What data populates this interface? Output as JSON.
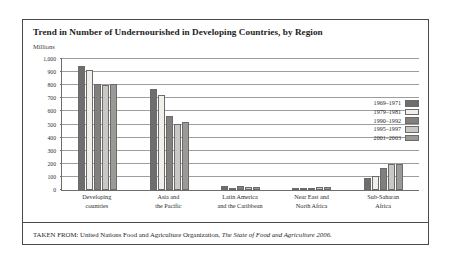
{
  "figure": {
    "title": "Trend in Number of Undernourished in Developing Countries, by Region",
    "unit_label": "Millions",
    "source_prefix": "TAKEN FROM: United Nations Food and Agriculture Organization,",
    "source_title": "The State of Food and Agriculture 2006."
  },
  "chart_data": {
    "type": "bar",
    "title": "Trend in Number of Undernourished in Developing Countries, by Region",
    "xlabel": "",
    "ylabel": "Millions",
    "ylim": [
      0,
      1000
    ],
    "yticks": [
      0,
      100,
      200,
      300,
      400,
      500,
      600,
      700,
      800,
      900,
      1000
    ],
    "ytick_labels": [
      "0",
      "100",
      "200",
      "300",
      "400",
      "500",
      "600",
      "700",
      "800",
      "900",
      "1,000"
    ],
    "grid": true,
    "legend_position": "right",
    "categories": [
      "Developing countries",
      "Asia and the Pacific",
      "Latin America and the Caribbean",
      "Near East and North Africa",
      "Sub-Saharan Africa"
    ],
    "category_lines": [
      [
        "Developing",
        "countries"
      ],
      [
        "Asia and",
        "the Pacific"
      ],
      [
        "Latin America",
        "and the Caribbean"
      ],
      [
        "Near East and",
        "North Africa"
      ],
      [
        "Sub-Saharan",
        "Africa"
      ]
    ],
    "series": [
      {
        "name": "1969–1971",
        "color": "#6e6e6e",
        "values": [
          945,
          772,
          28,
          18,
          88
        ]
      },
      {
        "name": "1979–1981",
        "color": "#f0efe9",
        "values": [
          918,
          726,
          13,
          8,
          110
        ]
      },
      {
        "name": "1990–1992",
        "color": "#82807d",
        "values": [
          812,
          566,
          30,
          12,
          165
        ]
      },
      {
        "name": "1995–1997",
        "color": "#c9c8c4",
        "values": [
          798,
          507,
          22,
          22,
          196
        ]
      },
      {
        "name": "2001–2003",
        "color": "#9b9a96",
        "values": [
          813,
          519,
          20,
          25,
          200
        ]
      }
    ]
  }
}
